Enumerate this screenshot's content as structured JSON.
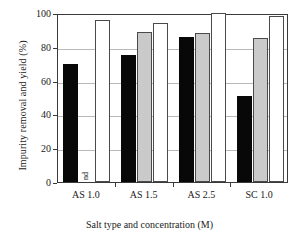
{
  "chart_data": {
    "type": "bar",
    "title": "",
    "xlabel": "Salt type and concentration (M)",
    "ylabel": "Impurity removal and yield (%)",
    "categories": [
      "AS 1.0",
      "AS 1.5",
      "AS 2.5",
      "SC 1.0"
    ],
    "series": [
      {
        "name": "series-black",
        "color": "#080808",
        "values": [
          70,
          75,
          86,
          51
        ]
      },
      {
        "name": "series-gray",
        "color": "#cacaca",
        "values": [
          null,
          89,
          88,
          85
        ]
      },
      {
        "name": "series-white",
        "color": "#ffffff",
        "values": [
          96,
          94,
          100,
          98
        ]
      }
    ],
    "annotations": [
      {
        "text": "nd",
        "category": "AS 1.0",
        "series": "series-gray",
        "note": "not detected"
      }
    ],
    "ylim": [
      0,
      100
    ],
    "yticks": [
      0,
      20,
      40,
      60,
      80,
      100
    ],
    "ytick_labels": [
      "0",
      "20",
      "40",
      "60",
      "80",
      "100"
    ],
    "grid": true,
    "legend": "none"
  },
  "axis": {
    "y_title": "Impurity removal and yield (%)",
    "x_title": "Salt type and concentration (M)"
  },
  "colors": {
    "frame": "#3a3a3a",
    "grid": "#b9b9b9",
    "bar_black": "#080808",
    "bar_gray": "#cacaca",
    "bar_white": "#ffffff",
    "bar_outline": "#4a4a4a",
    "background": "#ffffff"
  }
}
